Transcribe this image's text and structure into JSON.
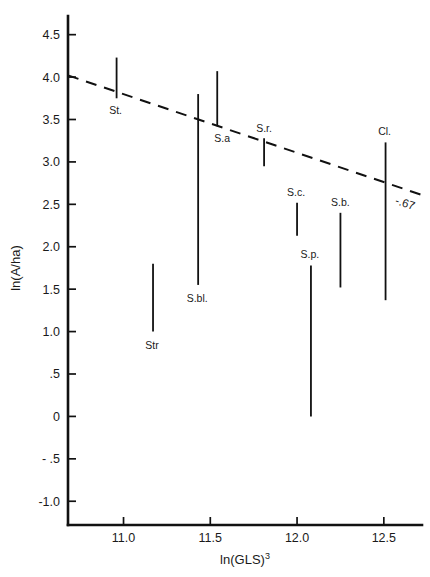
{
  "chart_data": {
    "type": "scatter",
    "title": "",
    "subtitle": "",
    "xlabel": "ln(GLS)",
    "xlabel_superscript": "3",
    "ylabel": "ln(A/ha)",
    "xlim": [
      10.68,
      12.72
    ],
    "ylim": [
      -1.28,
      4.72
    ],
    "xticks": [
      11.0,
      11.5,
      12.0,
      12.5
    ],
    "xtick_labels": [
      "11.0",
      "11.5",
      "12.0",
      "12.5"
    ],
    "yticks": [
      4.5,
      4.0,
      3.5,
      3.0,
      2.5,
      2.0,
      1.5,
      1.0,
      0.5,
      0.0,
      -0.5,
      -1.0
    ],
    "ytick_labels": [
      "4.5",
      "4.0",
      "3.5",
      "3.0",
      "2.5",
      "2.0",
      "1.5",
      "1.0",
      ".5",
      "0",
      "- .5",
      "-1.0"
    ],
    "grid": false,
    "legend": "none",
    "series": [
      {
        "name": "range-bars",
        "kind": "vertical-range",
        "points": [
          {
            "label": "St.",
            "x": 10.96,
            "y_low": 3.75,
            "y_high": 4.23,
            "label_dx": -1,
            "label_dy": 16
          },
          {
            "label": "Str",
            "x": 11.17,
            "y_low": 1.0,
            "y_high": 1.8,
            "label_dx": -1,
            "label_dy": 17
          },
          {
            "label": "S.bl.",
            "x": 11.43,
            "y_low": 1.55,
            "y_high": 3.8,
            "label_dx": -1,
            "label_dy": 17
          },
          {
            "label": "S.a",
            "x": 11.54,
            "y_low": 3.42,
            "y_high": 4.07,
            "label_dx": 5,
            "label_dy": 16
          },
          {
            "label": "S.r.",
            "x": 11.81,
            "y_low": 2.95,
            "y_high": 3.28,
            "label_dx": 0,
            "label_dy": -6
          },
          {
            "label": "S.c.",
            "x": 12.0,
            "y_low": 2.13,
            "y_high": 2.52,
            "label_dx": -1,
            "label_dy": -7
          },
          {
            "label": "S.p.",
            "x": 12.08,
            "y_low": 0.0,
            "y_high": 1.78,
            "label_dx": -1,
            "label_dy": -7
          },
          {
            "label": "S.b.",
            "x": 12.25,
            "y_low": 1.52,
            "y_high": 2.4,
            "label_dx": 0,
            "label_dy": -7
          },
          {
            "label": "Cl.",
            "x": 12.51,
            "y_low": 1.37,
            "y_high": 3.23,
            "label_dx": -1,
            "label_dy": -7
          }
        ]
      }
    ],
    "trendline": {
      "kind": "dashed",
      "x_start": 10.68,
      "y_start": 4.02,
      "x_end": 12.78,
      "y_end": 2.61,
      "annotation": "-.67"
    }
  }
}
